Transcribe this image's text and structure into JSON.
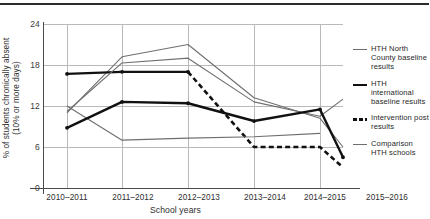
{
  "chart_data": {
    "type": "line",
    "title": "",
    "xlabel": "School years",
    "ylabel": "% of students chronically absent (10% or more days)",
    "ylabel_line1": "% of students chronically absent",
    "ylabel_line2": "(10% or more days)",
    "categories": [
      "2010–2011",
      "2011–2012",
      "2012–2013",
      "2013–2014",
      "2014–2015",
      "2015–2016"
    ],
    "yticks": [
      0,
      6,
      12,
      18,
      24
    ],
    "ylim": [
      0,
      24
    ],
    "grid": true,
    "legend_position": "right",
    "series": [
      {
        "name": "HTH North County baseline results",
        "style": "thin",
        "color": "#6f6f6f",
        "values": [
          11.0,
          19.2,
          21.0,
          13.2,
          10.2,
          6.0
        ]
      },
      {
        "name": "HTH international baseline results",
        "style": "thick",
        "color": "#111111",
        "values": [
          16.7,
          17.0,
          17.0,
          null,
          null,
          null
        ]
      },
      {
        "name": "Intervention post results",
        "style": "dashed",
        "color": "#111111",
        "values": [
          null,
          null,
          17.0,
          6.0,
          6.0,
          3.0
        ]
      },
      {
        "name": "Comparison HTH schools",
        "style": "thin",
        "color": "#6f6f6f",
        "values": [
          12.0,
          7.0,
          7.3,
          7.5,
          8.0,
          null
        ]
      },
      {
        "name": "HTH international trend",
        "style": "thin",
        "color": "#6f6f6f",
        "values": [
          11.2,
          18.3,
          19.0,
          12.6,
          10.5,
          13.0
        ]
      },
      {
        "name": "Intervention trend",
        "style": "thick",
        "color": "#111111",
        "values": [
          8.8,
          12.6,
          12.4,
          9.8,
          11.5,
          4.5
        ]
      }
    ],
    "legend_entries": [
      {
        "label": "HTH North County baseline results",
        "style": "thin"
      },
      {
        "label": "HTH international baseline results",
        "style": "thick"
      },
      {
        "label": "Intervention post results",
        "style": "dashed"
      },
      {
        "label": "Comparison HTH schools",
        "style": "thin"
      }
    ]
  }
}
